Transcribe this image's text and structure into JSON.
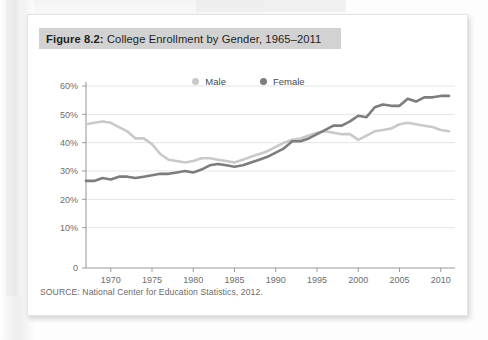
{
  "figure": {
    "label": "Figure 8.2:",
    "title": " College Enrollment by Gender, 1965–2011",
    "source": "SOURCE: National Center for Education Statistics, 2012."
  },
  "colors": {
    "male": "#c9c9c9",
    "female": "#7d7d7d",
    "axis": "#9b9b9b",
    "grid": "#e4e4e4",
    "title_band": "#d2d2d2",
    "tick_text": "#6d6d6d",
    "card": "#ffffff"
  },
  "legend": {
    "position": "top-center",
    "entries": [
      {
        "label": "Male",
        "color": "#c9c9c9",
        "marker": "circle"
      },
      {
        "label": "Female",
        "color": "#7d7d7d",
        "marker": "circle"
      }
    ]
  },
  "chart_data": {
    "type": "line",
    "title": "College Enrollment by Gender, 1965–2011",
    "subtitle": "",
    "xlabel": "",
    "ylabel": "",
    "grid": true,
    "grid_axis": "y",
    "xlim": [
      1967,
      2011
    ],
    "ylim": [
      0,
      60
    ],
    "ytick_labels": [
      "0",
      "10%",
      "20%",
      "30%",
      "40%",
      "50%",
      "60%"
    ],
    "ytick_values": [
      0,
      10,
      20,
      30,
      40,
      50,
      60
    ],
    "xtick_labels": [
      "1970",
      "1975",
      "1980",
      "1985",
      "1990",
      "1995",
      "2000",
      "2005",
      "2010"
    ],
    "xtick_values": [
      1970,
      1975,
      1980,
      1985,
      1990,
      1995,
      2000,
      2005,
      2010
    ],
    "x": [
      1967,
      1968,
      1969,
      1970,
      1971,
      1972,
      1973,
      1974,
      1975,
      1976,
      1977,
      1978,
      1979,
      1980,
      1981,
      1982,
      1983,
      1984,
      1985,
      1986,
      1987,
      1988,
      1989,
      1990,
      1991,
      1992,
      1993,
      1994,
      1995,
      1996,
      1997,
      1998,
      1999,
      2000,
      2001,
      2002,
      2003,
      2004,
      2005,
      2006,
      2007,
      2008,
      2009,
      2010,
      2011
    ],
    "series": [
      {
        "name": "Male",
        "color": "#c9c9c9",
        "values": [
          46.5,
          47.0,
          47.5,
          47.0,
          45.5,
          44.0,
          41.5,
          41.5,
          39.5,
          36.0,
          34.0,
          33.5,
          33.0,
          33.5,
          34.5,
          34.5,
          34.0,
          33.5,
          33.0,
          34.0,
          35.0,
          36.0,
          37.0,
          38.5,
          40.0,
          41.0,
          41.5,
          42.5,
          43.5,
          44.0,
          43.5,
          43.0,
          43.0,
          41.0,
          42.5,
          44.0,
          44.5,
          45.0,
          46.5,
          47.0,
          46.5,
          46.0,
          45.5,
          44.5,
          44.0
        ]
      },
      {
        "name": "Female",
        "color": "#7d7d7d",
        "values": [
          26.5,
          26.5,
          27.5,
          27.0,
          28.0,
          28.0,
          27.5,
          28.0,
          28.5,
          29.0,
          29.0,
          29.5,
          30.0,
          29.5,
          30.5,
          32.0,
          32.5,
          32.0,
          31.5,
          32.0,
          33.0,
          34.0,
          35.0,
          36.5,
          38.0,
          40.5,
          40.5,
          41.5,
          43.0,
          44.5,
          46.0,
          46.0,
          47.5,
          49.5,
          49.0,
          52.5,
          53.5,
          53.0,
          53.0,
          55.5,
          54.5,
          56.0,
          56.0,
          56.5,
          56.5
        ]
      }
    ]
  }
}
